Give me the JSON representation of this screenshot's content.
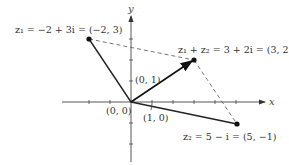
{
  "diagram": {
    "axes": {
      "x_label": "x",
      "y_label": "y",
      "origin_label": "(0, 0)",
      "unit_x_label": "(1, 0)",
      "unit_y_label": "(0, 1)"
    },
    "points": {
      "z1": {
        "label": "z₁ = −2 + 3i = (−2, 3)",
        "x": -2,
        "y": 3
      },
      "z2": {
        "label": "z₂ = 5 − i = (5, −1)",
        "x": 5,
        "y": -1
      },
      "sum": {
        "label": "z₁ + z₂ = 3 + 2i = (3, 2)",
        "x": 3,
        "y": 2
      }
    },
    "colors": {
      "line": "#222222",
      "dashed": "#555555",
      "axis": "#444444",
      "text": "#333333"
    }
  }
}
